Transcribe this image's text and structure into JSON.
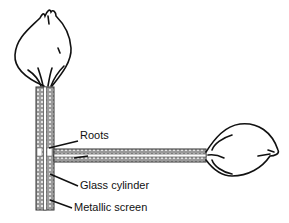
{
  "diagram": {
    "labels": {
      "roots": "Roots",
      "glass_cylinder": "Glass cylinder",
      "metallic_screen": "Metallic screen"
    },
    "colors": {
      "stroke": "#111111",
      "tube_fill": "#8a8a8a",
      "background": "#ffffff"
    }
  }
}
